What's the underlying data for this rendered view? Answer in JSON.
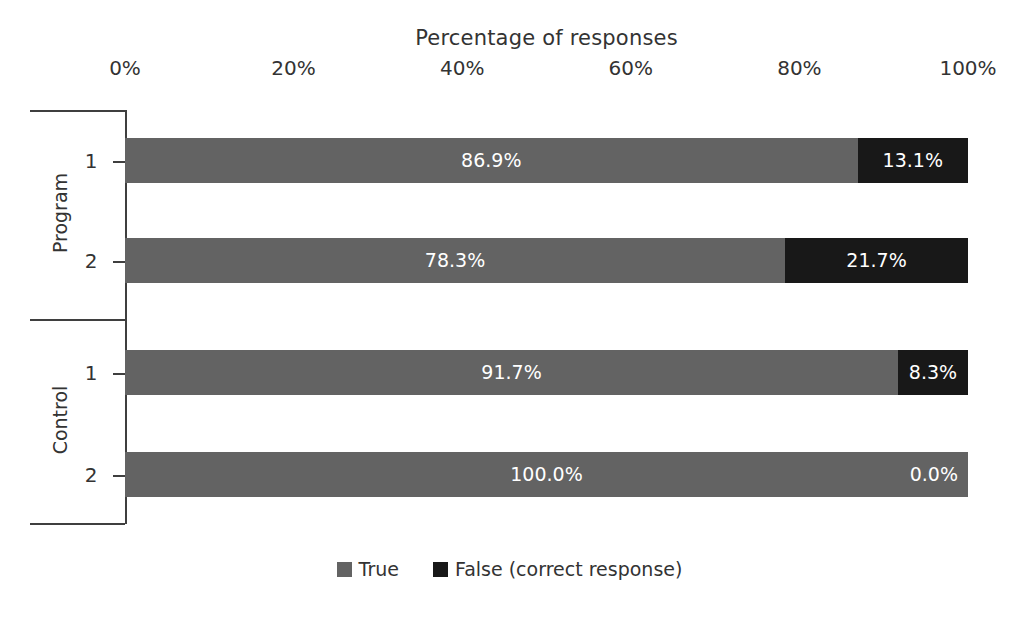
{
  "chart_data": {
    "type": "bar",
    "orientation": "horizontal",
    "stacked": true,
    "normalized": true,
    "title": "Percentage of responses",
    "xlabel": "",
    "ylabel": "",
    "xlim": [
      0,
      100
    ],
    "xticks": [
      "0%",
      "20%",
      "40%",
      "60%",
      "80%",
      "100%"
    ],
    "xtick_values": [
      0,
      20,
      40,
      60,
      80,
      100
    ],
    "grid": false,
    "legend_position": "bottom",
    "legend": [
      {
        "name": "True",
        "color": "#636363"
      },
      {
        "name": "False (correct response)",
        "color": "#181818"
      }
    ],
    "groups": [
      {
        "name": "Program",
        "categories": [
          {
            "label": "1",
            "segments": [
              {
                "series": "True",
                "value": 86.9,
                "label": "86.9%"
              },
              {
                "series": "False (correct response)",
                "value": 13.1,
                "label": "13.1%"
              }
            ]
          },
          {
            "label": "2",
            "segments": [
              {
                "series": "True",
                "value": 78.3,
                "label": "78.3%"
              },
              {
                "series": "False (correct response)",
                "value": 21.7,
                "label": "21.7%"
              }
            ]
          }
        ]
      },
      {
        "name": "Control",
        "categories": [
          {
            "label": "1",
            "segments": [
              {
                "series": "True",
                "value": 91.7,
                "label": "91.7%"
              },
              {
                "series": "False (correct response)",
                "value": 8.3,
                "label": "8.3%"
              }
            ]
          },
          {
            "label": "2",
            "segments": [
              {
                "series": "True",
                "value": 100.0,
                "label": "100.0%"
              },
              {
                "series": "False (correct response)",
                "value": 0.0,
                "label": "0.0%"
              }
            ]
          }
        ]
      }
    ],
    "series": [
      {
        "name": "True",
        "values": [
          86.9,
          78.3,
          91.7,
          100.0
        ]
      },
      {
        "name": "False (correct response)",
        "values": [
          13.1,
          21.7,
          8.3,
          0.0
        ]
      }
    ],
    "categories": [
      "Program 1",
      "Program 2",
      "Control 1",
      "Control 2"
    ],
    "colors": {
      "true": "#636363",
      "false": "#181818",
      "axis": "#3f3f3f",
      "text": "#333333",
      "background": "#ffffff"
    }
  },
  "layout": {
    "plot_left": 125,
    "plot_width": 843,
    "bars": [
      {
        "top": 138,
        "height": 45
      },
      {
        "top": 238,
        "height": 45
      },
      {
        "top": 350,
        "height": 45
      },
      {
        "top": 452,
        "height": 45
      }
    ],
    "group_label_centers": [
      214,
      421
    ],
    "sub_label_centers": [
      160,
      260,
      372,
      474
    ]
  }
}
